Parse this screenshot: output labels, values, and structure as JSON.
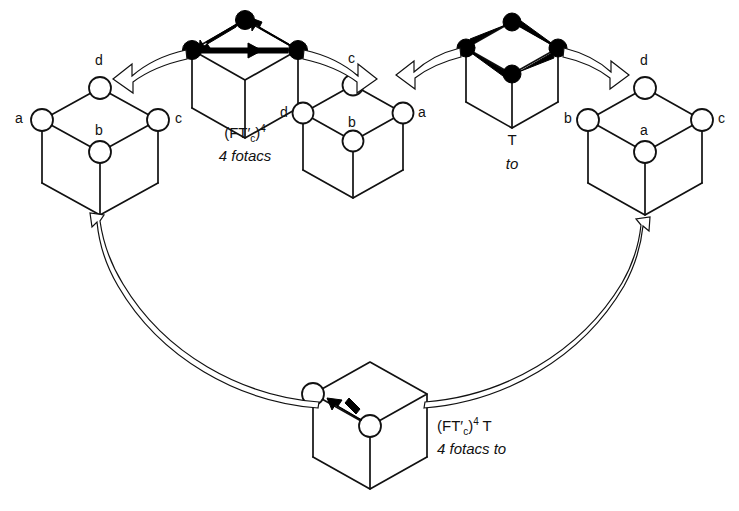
{
  "figure": {
    "background": "#ffffff",
    "stroke": "#111111",
    "node_fill": "#ffffff",
    "filled_node_fill": "#000000"
  },
  "cubes": [
    {
      "id": "cube-source",
      "name": "source-cube",
      "role": "start configuration",
      "vertex_labels": {
        "top": "d",
        "left": "a",
        "right": "c",
        "center": "b"
      },
      "node_style": "open"
    },
    {
      "id": "cube-operator-fotacs",
      "name": "operator-cube-fotacs",
      "role": "operator",
      "vertex_labels": {
        "top": "",
        "left": "",
        "right": "",
        "center": ""
      },
      "node_style": "filled",
      "caption_line1_pre": "(FT",
      "caption_line1_prime": "′",
      "caption_line1_sub": "c",
      "caption_line1_post": ")",
      "caption_line1_sup": "4",
      "caption_line2": "4 fotacs"
    },
    {
      "id": "cube-middle",
      "name": "intermediate-cube",
      "role": "intermediate configuration",
      "vertex_labels": {
        "top": "c",
        "left": "d",
        "right": "a",
        "center": "b"
      },
      "node_style": "open"
    },
    {
      "id": "cube-operator-to",
      "name": "operator-cube-to",
      "role": "operator",
      "vertex_labels": {
        "top": "",
        "left": "",
        "right": "",
        "center": ""
      },
      "node_style": "filled",
      "caption_line1": "T",
      "caption_line2": "to"
    },
    {
      "id": "cube-result",
      "name": "result-cube",
      "role": "final configuration",
      "vertex_labels": {
        "top": "d",
        "left": "b",
        "right": "c",
        "center": "a"
      },
      "node_style": "open"
    },
    {
      "id": "cube-composite",
      "name": "composite-operator-cube",
      "role": "composite operator",
      "node_style": "open",
      "caption_line1_pre": "(FT",
      "caption_line1_prime": "′",
      "caption_line1_sub": "c",
      "caption_line1_post": ")",
      "caption_line1_sup": "4",
      "caption_line1_tail": " T",
      "caption_line2": "4 fotacs to"
    }
  ],
  "labels": {
    "source": {
      "top": "d",
      "left": "a",
      "right": "c",
      "center": "b"
    },
    "middle": {
      "top": "c",
      "left": "d",
      "right": "a",
      "center": "b"
    },
    "result": {
      "top": "d",
      "left": "b",
      "right": "c",
      "center": "a"
    },
    "operator_fotacs_line2": "4 fotacs",
    "operator_to_line1": "T",
    "operator_to_line2": "to",
    "composite_line2": "4 fotacs to",
    "paren_open": "(",
    "ft": "FT",
    "prime": "′",
    "sub_c": "c",
    "paren_close": ")",
    "sup_4": "4",
    "tail_T": " T",
    "four": "4"
  },
  "arrows": [
    {
      "name": "arrow-operator-fotacs-to-source",
      "from": "operator-cube-fotacs",
      "to": "source-cube",
      "style": "hollow-ribbon",
      "direction": "left"
    },
    {
      "name": "arrow-operator-fotacs-to-middle",
      "from": "operator-cube-fotacs",
      "to": "intermediate-cube",
      "style": "hollow-ribbon",
      "direction": "right"
    },
    {
      "name": "arrow-operator-to-to-middle",
      "from": "operator-cube-to",
      "to": "intermediate-cube",
      "style": "hollow-ribbon",
      "direction": "left"
    },
    {
      "name": "arrow-operator-to-to-result",
      "from": "operator-cube-to",
      "to": "result-cube",
      "style": "hollow-ribbon",
      "direction": "right"
    },
    {
      "name": "arrow-composite-to-source",
      "from": "composite-operator-cube",
      "to": "source-cube",
      "style": "hollow-ribbon-long",
      "direction": "up-left"
    },
    {
      "name": "arrow-composite-to-result",
      "from": "composite-operator-cube",
      "to": "result-cube",
      "style": "hollow-ribbon-long",
      "direction": "up-right"
    }
  ],
  "permutation_arrows": {
    "fotacs": [
      {
        "from": "top-node",
        "to": "left-node"
      },
      {
        "from": "left-node",
        "to": "right-node"
      },
      {
        "from": "right-node",
        "to": "top-node"
      }
    ],
    "to": [
      {
        "from": "left-node",
        "to": "top-node"
      },
      {
        "from": "top-node",
        "to": "right-node"
      },
      {
        "from": "right-node",
        "to": "bottom-node"
      },
      {
        "from": "bottom-node",
        "to": "left-node"
      }
    ],
    "composite": [
      {
        "from": "center-node",
        "to": "left-node"
      }
    ]
  }
}
